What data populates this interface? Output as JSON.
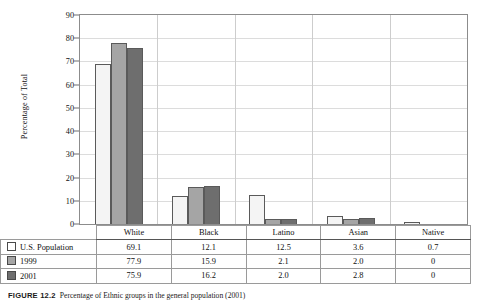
{
  "chart_data": {
    "type": "bar",
    "title": "",
    "xlabel": "",
    "ylabel": "Percentage of Total",
    "ylim": [
      0,
      90
    ],
    "ytick_step": 10,
    "yticks": [
      90,
      80,
      70,
      60,
      50,
      40,
      30,
      20,
      10,
      0
    ],
    "grid": true,
    "legend_position": "table-below",
    "categories": [
      "White",
      "Black",
      "Latino",
      "Asian",
      "Native"
    ],
    "series": [
      {
        "name": "U.S. Population",
        "values": [
          69.1,
          12.1,
          12.5,
          3.6,
          0.7
        ],
        "color": "#f4f4f4"
      },
      {
        "name": "1999",
        "values": [
          77.9,
          15.9,
          2.1,
          2.0,
          0
        ],
        "color": "#a5a5a5"
      },
      {
        "name": "2001",
        "values": [
          75.9,
          16.2,
          2.0,
          2.8,
          0
        ],
        "color": "#6e6e6e"
      }
    ],
    "table": {
      "header": [
        "",
        "White",
        "Black",
        "Latino",
        "Asian",
        "Native"
      ],
      "rows": [
        {
          "label": "U.S. Population",
          "swatch": "swatch-white",
          "cells": [
            "69.1",
            "12.1",
            "12.5",
            "3.6",
            "0.7"
          ]
        },
        {
          "label": "1999",
          "swatch": "swatch-gray",
          "cells": [
            "77.9",
            "15.9",
            "2.1",
            "2.0",
            "0"
          ]
        },
        {
          "label": "2001",
          "swatch": "swatch-dark-gray",
          "cells": [
            "75.9",
            "16.2",
            "2.0",
            "2.8",
            "0"
          ]
        }
      ]
    }
  },
  "caption": {
    "label": "FIGURE 12.2",
    "text": "Percentage of Ethnic groups in the general population (2001)"
  },
  "colors": {
    "series_us_population": "#f4f4f4",
    "series_1999": "#a5a5a5",
    "series_2001": "#6e6e6e",
    "axis": "#8c8c8c",
    "gridline": "#dcdcdc"
  }
}
